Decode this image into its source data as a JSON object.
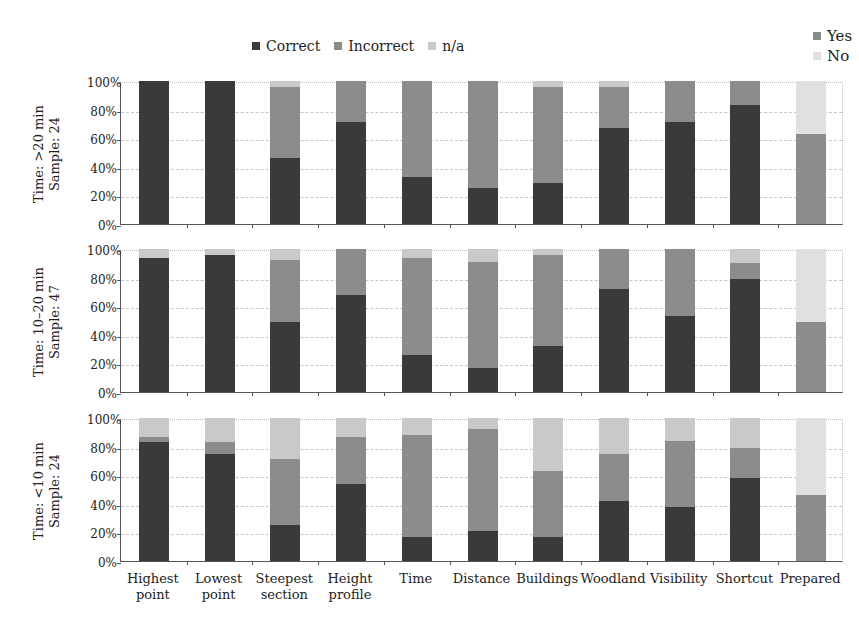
{
  "legend_main": [
    {
      "label": "Correct",
      "color": "#3a3a3a"
    },
    {
      "label": "Incorrect",
      "color": "#8c8c8c"
    },
    {
      "label": "n/a",
      "color": "#c9c9c9"
    }
  ],
  "legend_prepared": [
    {
      "label": "Yes",
      "color": "#8c8c8c"
    },
    {
      "label": "No",
      "color": "#e0e0e0"
    }
  ],
  "y_ticks": [
    "100%",
    "80%",
    "60%",
    "40%",
    "20%",
    "0%"
  ],
  "categories": [
    {
      "line1": "Highest",
      "line2": "point"
    },
    {
      "line1": "Lowest",
      "line2": "point"
    },
    {
      "line1": "Steepest",
      "line2": "section"
    },
    {
      "line1": "Height",
      "line2": "profile"
    },
    {
      "line1": "Time",
      "line2": ""
    },
    {
      "line1": "Distance",
      "line2": ""
    },
    {
      "line1": "Buildings",
      "line2": ""
    },
    {
      "line1": "Woodland",
      "line2": ""
    },
    {
      "line1": "Visibility",
      "line2": ""
    },
    {
      "line1": "Shortcut",
      "line2": ""
    },
    {
      "line1": "Prepared",
      "line2": ""
    }
  ],
  "panels": [
    {
      "label1": "Time: >20 min",
      "label2": "Sample: 24"
    },
    {
      "label1": "Time: 10–20 min",
      "label2": "Sample: 47"
    },
    {
      "label1": "Time: <10 min",
      "label2": "Sample: 24"
    }
  ],
  "chart_data": {
    "type": "bar",
    "stacked": true,
    "normalized": "100%",
    "title": "",
    "xlabel": "",
    "ylabel": "",
    "ylim": [
      0,
      100
    ],
    "grid": true,
    "legend_position": "top",
    "categories": [
      "Highest point",
      "Lowest point",
      "Steepest section",
      "Height profile",
      "Time",
      "Distance",
      "Buildings",
      "Woodland",
      "Visibility",
      "Shortcut",
      "Prepared"
    ],
    "note": "The 'Prepared' category uses series Yes/No instead of Correct/Incorrect/n/a",
    "panels": [
      {
        "label": "Time: >20 min, Sample: 24",
        "series": [
          {
            "name": "Correct",
            "values": [
              100,
              100,
              46,
              71,
              33,
              25,
              29,
              67,
              71,
              83,
              null
            ]
          },
          {
            "name": "Incorrect",
            "values": [
              0,
              0,
              50,
              29,
              67,
              75,
              67,
              29,
              29,
              17,
              null
            ]
          },
          {
            "name": "n/a",
            "values": [
              0,
              0,
              4,
              0,
              0,
              0,
              4,
              4,
              0,
              0,
              null
            ]
          },
          {
            "name": "Yes",
            "values": [
              null,
              null,
              null,
              null,
              null,
              null,
              null,
              null,
              null,
              null,
              63
            ]
          },
          {
            "name": "No",
            "values": [
              null,
              null,
              null,
              null,
              null,
              null,
              null,
              null,
              null,
              null,
              37
            ]
          }
        ]
      },
      {
        "label": "Time: 10–20 min, Sample: 47",
        "series": [
          {
            "name": "Correct",
            "values": [
              94,
              96,
              49,
              68,
              26,
              17,
              32,
              72,
              53,
              79,
              null
            ]
          },
          {
            "name": "Incorrect",
            "values": [
              0,
              0,
              43,
              32,
              68,
              74,
              64,
              28,
              47,
              11,
              null
            ]
          },
          {
            "name": "n/a",
            "values": [
              6,
              4,
              8,
              0,
              6,
              9,
              4,
              0,
              0,
              10,
              null
            ]
          },
          {
            "name": "Yes",
            "values": [
              null,
              null,
              null,
              null,
              null,
              null,
              null,
              null,
              null,
              null,
              49
            ]
          },
          {
            "name": "No",
            "values": [
              null,
              null,
              null,
              null,
              null,
              null,
              null,
              null,
              null,
              null,
              51
            ]
          }
        ]
      },
      {
        "label": "Time: <10 min, Sample: 24",
        "series": [
          {
            "name": "Correct",
            "values": [
              83,
              75,
              25,
              54,
              17,
              21,
              17,
              42,
              38,
              58,
              null
            ]
          },
          {
            "name": "Incorrect",
            "values": [
              4,
              8,
              46,
              33,
              71,
              71,
              46,
              33,
              46,
              21,
              null
            ]
          },
          {
            "name": "n/a",
            "values": [
              13,
              17,
              29,
              13,
              12,
              8,
              37,
              25,
              16,
              21,
              null
            ]
          },
          {
            "name": "Yes",
            "values": [
              null,
              null,
              null,
              null,
              null,
              null,
              null,
              null,
              null,
              null,
              46
            ]
          },
          {
            "name": "No",
            "values": [
              null,
              null,
              null,
              null,
              null,
              null,
              null,
              null,
              null,
              null,
              54
            ]
          }
        ]
      }
    ]
  }
}
